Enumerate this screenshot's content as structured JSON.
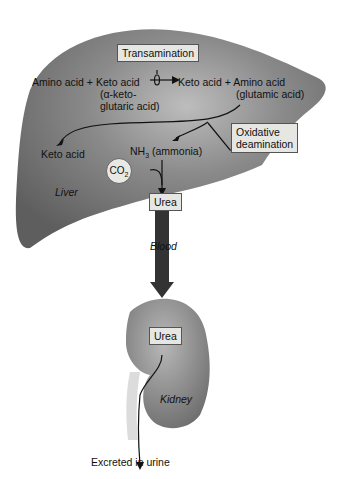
{
  "diagram": {
    "organs": {
      "liver": "Liver",
      "kidney": "Kidney"
    },
    "boxes": {
      "transamination": "Transamination",
      "oxidative_1": "Oxidative",
      "oxidative_2": "deamination",
      "urea_liver": "Urea",
      "urea_kidney": "Urea"
    },
    "labels": {
      "reactants": "Amino acid + Keto acid",
      "reactant_note_1": "(α-keto-",
      "reactant_note_2": "glutaric acid)",
      "products": "Keto acid + Amino acid",
      "product_note": "(glutamic acid)",
      "keto_acid": "Keto acid",
      "nh3": "NH",
      "nh3_sub": "3",
      "ammonia": " (ammonia)",
      "co2": "CO",
      "co2_sub": "2",
      "blood": "Blood",
      "excreted": "Excreted in urine"
    },
    "colors": {
      "organ": "#7a7a7a",
      "organ_highlight": "#b9b9b9",
      "box": "#e6e6e2",
      "arrow": "#2a2a2a"
    }
  }
}
